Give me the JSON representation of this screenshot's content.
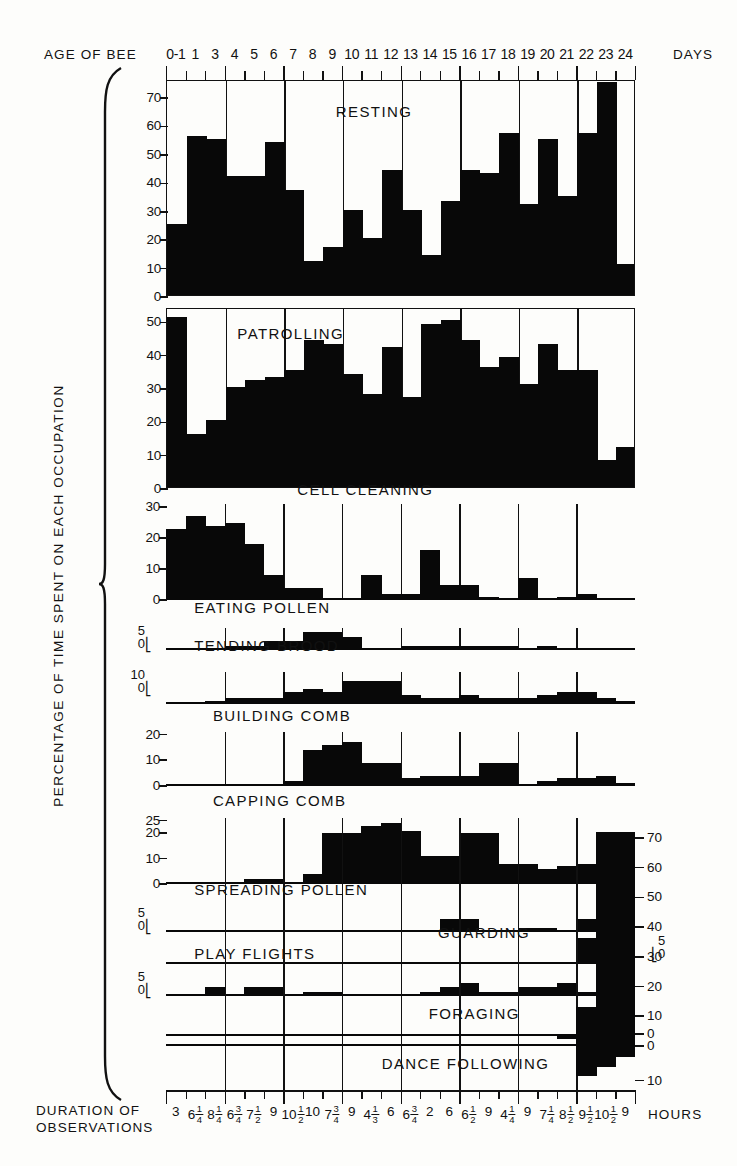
{
  "axes": {
    "top_title": "AGE OF BEE",
    "top_unit": "DAYS",
    "y_title": "PERCENTAGE OF TIME SPENT ON EACH OCCUPATION",
    "bottom_title_line1": "DURATION OF",
    "bottom_title_line2": "OBSERVATIONS",
    "bottom_unit": "HOURS",
    "day_labels": [
      "0-1",
      "1",
      "3",
      "4",
      "5",
      "6",
      "7",
      "8",
      "9",
      "10",
      "11",
      "12",
      "13",
      "14",
      "15",
      "16",
      "17",
      "18",
      "19",
      "20",
      "21",
      "22",
      "23",
      "24"
    ],
    "duration_labels": [
      "3",
      "6 1/4",
      "8 1/4",
      "6 3/4",
      "7 1/2",
      "9",
      "10 1/2",
      "10",
      "7 3/4",
      "9",
      "4 1/3",
      "6",
      "6 3/4",
      "2",
      "6",
      "6 1/2",
      "9",
      "4 1/4",
      "9",
      "7 1/4",
      "8 1/2",
      "9 1/2",
      "10 1/2",
      "9"
    ]
  },
  "chart_data": {
    "type": "bar",
    "xlabel": "AGE OF BEE (DAYS)",
    "ylabel": "PERCENTAGE OF TIME SPENT ON EACH OCCUPATION",
    "grid": true,
    "legend": "none",
    "categories": [
      "0-1",
      "1",
      "3",
      "4",
      "5",
      "6",
      "7",
      "8",
      "9",
      "10",
      "11",
      "12",
      "13",
      "14",
      "15",
      "16",
      "17",
      "18",
      "19",
      "20",
      "21",
      "22",
      "23",
      "24"
    ],
    "duration_hours": [
      3,
      6.25,
      8.25,
      6.75,
      7.5,
      9,
      10.5,
      10,
      7.75,
      9,
      4.333,
      6,
      6.75,
      2,
      6,
      6.5,
      9,
      4.25,
      9,
      7.25,
      8.5,
      9.5,
      10.5,
      9
    ],
    "panels": [
      {
        "name": "RESTING",
        "ylim": [
          0,
          76
        ],
        "yticks": [
          0,
          10,
          20,
          30,
          40,
          50,
          60,
          70
        ],
        "values": [
          25,
          56,
          55,
          42,
          42,
          54,
          37,
          12,
          17,
          30,
          20,
          44,
          30,
          14,
          33,
          44,
          43,
          57,
          32,
          55,
          35,
          57,
          75,
          11
        ]
      },
      {
        "name": "PATROLLING",
        "ylim": [
          0,
          54
        ],
        "yticks": [
          0,
          10,
          20,
          30,
          40,
          50
        ],
        "values": [
          51,
          16,
          20,
          30,
          32,
          33,
          35,
          44,
          43,
          34,
          28,
          42,
          27,
          49,
          50,
          44,
          36,
          39,
          31,
          43,
          35,
          35,
          8,
          12
        ]
      },
      {
        "name": "CELL CLEANING",
        "ylim": [
          0,
          31
        ],
        "yticks": [
          0,
          10,
          20,
          30
        ],
        "values": [
          23,
          27,
          24,
          25,
          18,
          8,
          4,
          4,
          0,
          0,
          8,
          2,
          2,
          16,
          5,
          5,
          1,
          0,
          7,
          0,
          1,
          2,
          0,
          0
        ]
      },
      {
        "name": "EATING POLLEN",
        "ylim": [
          0,
          5
        ],
        "yticks": [
          0,
          5
        ],
        "values": [
          0,
          0,
          0,
          1,
          1,
          2,
          2,
          4,
          4,
          3,
          0,
          0,
          1,
          1,
          1,
          1,
          1,
          1,
          0,
          1,
          0,
          0,
          0,
          0
        ]
      },
      {
        "name": "TENDING BROOD",
        "ylim": [
          0,
          11
        ],
        "yticks": [
          0,
          10
        ],
        "values": [
          0,
          0,
          1,
          2,
          2,
          2,
          4,
          5,
          4,
          8,
          8,
          8,
          3,
          2,
          2,
          3,
          2,
          2,
          2,
          3,
          4,
          4,
          2,
          1
        ]
      },
      {
        "name": "BUILDING COMB",
        "ylim": [
          0,
          21
        ],
        "yticks": [
          0,
          10,
          20
        ],
        "values": [
          0,
          0,
          0,
          0,
          0,
          0,
          2,
          14,
          16,
          17,
          9,
          9,
          3,
          4,
          4,
          4,
          9,
          9,
          0,
          2,
          3,
          3,
          4,
          1
        ]
      },
      {
        "name": "CAPPING COMB",
        "ylim": [
          0,
          26
        ],
        "yticks": [
          0,
          10,
          20,
          25
        ],
        "values": [
          0,
          0,
          0,
          0,
          2,
          2,
          0,
          4,
          20,
          20,
          23,
          24,
          21,
          11,
          11,
          20,
          20,
          8,
          8,
          6,
          7,
          8,
          8,
          5
        ]
      },
      {
        "name": "SPREADING POLLEN",
        "ylim": [
          0,
          5
        ],
        "yticks": [
          0,
          5
        ],
        "values": [
          0,
          0,
          0,
          0,
          0,
          0,
          0,
          0,
          0,
          0,
          0,
          0,
          0,
          0,
          3,
          3,
          0,
          0,
          1,
          1,
          0,
          3,
          3,
          0
        ]
      },
      {
        "name": "GUARDING",
        "ylim": [
          0,
          5
        ],
        "yticks": [
          0,
          5
        ],
        "values": [
          0,
          0,
          0,
          0,
          0,
          0,
          0,
          0,
          0,
          0,
          0,
          0,
          0,
          0,
          0,
          0,
          0,
          0,
          0,
          0,
          0,
          5,
          5,
          0
        ]
      },
      {
        "name": "PLAY FLIGHTS",
        "ylim": [
          0,
          5
        ],
        "yticks": [
          0,
          5
        ],
        "values": [
          0,
          0,
          2,
          0,
          2,
          2,
          0,
          1,
          1,
          0,
          0,
          0,
          0,
          1,
          2,
          3,
          1,
          1,
          2,
          2,
          3,
          1,
          0,
          0
        ]
      },
      {
        "name": "FORAGING",
        "ylim": [
          0,
          76
        ],
        "yticks": [
          0,
          10,
          20,
          30,
          40,
          50,
          60,
          70
        ],
        "values": [
          0,
          0,
          0,
          0,
          0,
          0,
          0,
          0,
          0,
          0,
          0,
          0,
          0,
          0,
          0,
          0,
          0,
          0,
          0,
          0,
          0,
          13,
          72,
          72
        ]
      },
      {
        "name": "DANCE FOLLOWING",
        "ylim": [
          0,
          12
        ],
        "yticks": [
          0,
          10
        ],
        "values": [
          0,
          0,
          0,
          0,
          0,
          0,
          0,
          0,
          0,
          0,
          0,
          0,
          0,
          0,
          0,
          0,
          0,
          0,
          0,
          0,
          1,
          9,
          7,
          5
        ]
      }
    ]
  },
  "panel_labels": {
    "resting": "RESTING",
    "patrolling": "PATROLLING",
    "cell_cleaning": "CELL CLEANING",
    "eating_pollen": "EATING POLLEN",
    "tending_brood": "TENDING BROOD",
    "building_comb": "BUILDING COMB",
    "capping_comb": "CAPPING COMB",
    "spreading_pollen": "SPREADING POLLEN",
    "guarding": "GUARDING",
    "play_flights": "PLAY FLIGHTS",
    "foraging": "FORAGING",
    "dance_following": "DANCE FOLLOWING"
  },
  "colors": {
    "ink": "#111111",
    "bar": "#080808",
    "background": "#fdfdfb"
  }
}
